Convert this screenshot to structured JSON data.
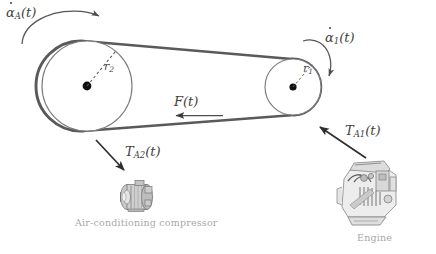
{
  "figure": {
    "background_color": "#ffffff",
    "belt_color": "#5a5a5a",
    "pulley_outline_color": "#6e6e6e",
    "hub_color": "#111111",
    "annotation_color": "#404040",
    "caption_color": "#a8a8a8"
  },
  "pulleys": {
    "large": {
      "name": "compressor-pulley",
      "center_x": 87,
      "center_y": 86,
      "radius": 45,
      "radius_label_base": "r",
      "radius_label_sub": "2"
    },
    "small": {
      "name": "engine-pulley",
      "center_x": 293,
      "center_y": 87,
      "radius": 28,
      "radius_label_base": "r",
      "radius_label_sub": "1"
    }
  },
  "annotations": {
    "alpha_A": {
      "base": "α",
      "sub": "A",
      "arg": "(t)",
      "description": "angular-velocity-compressor-pulley"
    },
    "alpha_1": {
      "base": "α",
      "sub": "1",
      "arg": "(t)",
      "description": "angular-velocity-engine-pulley"
    },
    "force": {
      "base": "F",
      "arg": "(t)",
      "description": "belt-tension-force"
    },
    "torque_A2": {
      "base": "T",
      "sub": "A2",
      "arg": "(t)",
      "description": "torque-on-compressor"
    },
    "torque_A1": {
      "base": "T",
      "sub": "A1",
      "arg": "(t)",
      "description": "torque-from-engine"
    }
  },
  "captions": {
    "compressor": "Air-conditioning compressor",
    "engine": "Engine"
  }
}
